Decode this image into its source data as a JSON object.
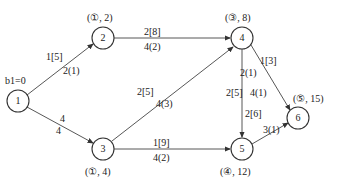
{
  "diagram": {
    "type": "network-flow",
    "start_label": "b1=0",
    "nodes": [
      {
        "id": "1",
        "label": "1",
        "x": 18,
        "y": 101,
        "mark": ""
      },
      {
        "id": "2",
        "label": "2",
        "x": 103,
        "y": 38,
        "mark": "(①, 2)"
      },
      {
        "id": "3",
        "label": "3",
        "x": 103,
        "y": 149,
        "mark": "(①, 4)"
      },
      {
        "id": "4",
        "label": "4",
        "x": 242,
        "y": 38,
        "mark": "(③, 8)"
      },
      {
        "id": "5",
        "label": "5",
        "x": 242,
        "y": 149,
        "mark": "(④, 12)"
      },
      {
        "id": "6",
        "label": "6",
        "x": 298,
        "y": 118,
        "mark": "(⑤, 15)"
      }
    ],
    "edges": [
      {
        "from": "1",
        "to": "2",
        "top": "1[5]",
        "bottom": "2(1)"
      },
      {
        "from": "1",
        "to": "3",
        "top": "4",
        "bottom": "4"
      },
      {
        "from": "2",
        "to": "4",
        "top": "2[8]",
        "bottom": "4(2)"
      },
      {
        "from": "3",
        "to": "4",
        "top": "2[5]",
        "bottom": "4(3)"
      },
      {
        "from": "3",
        "to": "5",
        "top": "1[9]",
        "bottom": "4(2)"
      },
      {
        "from": "4",
        "to": "5",
        "top": "2[5]",
        "bottom": "4(1)"
      },
      {
        "from": "4",
        "to": "6",
        "top": "1[3]",
        "bottom": "2(1)"
      },
      {
        "from": "5",
        "to": "6",
        "top": "2[6]",
        "bottom": "3(1)"
      }
    ]
  }
}
